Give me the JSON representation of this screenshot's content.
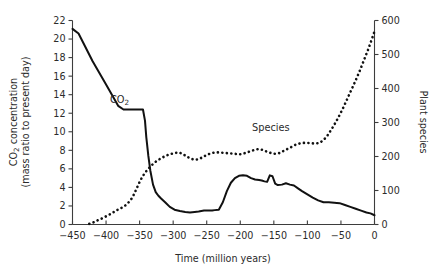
{
  "chart_data": {
    "type": "line",
    "title": "",
    "xlabel": "Time (million years)",
    "ylabel": "CO2 concentration (mass ratio to present day)",
    "y2label": "Plant species",
    "xlim": [
      -450,
      0
    ],
    "ylim": [
      0,
      22
    ],
    "y2lim": [
      0,
      600
    ],
    "grid": false,
    "legend_position": "inline-annotations",
    "xticks": [
      -450,
      -400,
      -350,
      -300,
      -250,
      -200,
      -150,
      -100,
      -50,
      0
    ],
    "xticklabels": [
      "−450",
      "−400",
      "−350",
      "−300",
      "−250",
      "−200",
      "−150",
      "−100",
      "−50",
      "0"
    ],
    "yticks": [
      0,
      2,
      4,
      6,
      8,
      10,
      12,
      14,
      16,
      18,
      20,
      22
    ],
    "yticklabels": [
      "0",
      "2",
      "4",
      "6",
      "8",
      "10",
      "12",
      "14",
      "16",
      "18",
      "20",
      "22"
    ],
    "y2ticks": [
      0,
      100,
      200,
      300,
      400,
      500,
      600
    ],
    "y2ticklabels": [
      "0",
      "100",
      "200",
      "300",
      "400",
      "500",
      "600"
    ],
    "annotations": [
      {
        "text": "CO2",
        "x": -388,
        "y": 13.8,
        "series": "co2"
      },
      {
        "text": "Species",
        "x": -180,
        "y": 9.9,
        "series": "species"
      }
    ],
    "series": [
      {
        "name": "CO2",
        "axis": "left",
        "style": "solid",
        "label_text": "CO₂",
        "x": [
          -450,
          -441,
          -420,
          -400,
          -382,
          -374,
          -368,
          -360,
          -356,
          -352,
          -348,
          -345,
          -342,
          -340,
          -337,
          -334,
          -330,
          -326,
          -322,
          -318,
          -312,
          -305,
          -298,
          -290,
          -282,
          -275,
          -268,
          -262,
          -258,
          -254,
          -250,
          -246,
          -242,
          -238,
          -232,
          -226,
          -220,
          -214,
          -208,
          -202,
          -196,
          -190,
          -184,
          -178,
          -172,
          -168,
          -164,
          -160,
          -156,
          -152,
          -148,
          -144,
          -138,
          -132,
          -126,
          -120,
          -114,
          -108,
          -100,
          -92,
          -84,
          -76,
          -68,
          -60,
          -52,
          -44,
          -36,
          -28,
          -20,
          -12,
          -6,
          0
        ],
        "y": [
          21.1,
          20.6,
          17.6,
          15.1,
          12.8,
          12.4,
          12.4,
          12.4,
          12.4,
          12.4,
          12.4,
          12.4,
          11.2,
          9.4,
          7.4,
          5.8,
          4.3,
          3.5,
          3.1,
          2.8,
          2.4,
          1.9,
          1.6,
          1.45,
          1.35,
          1.3,
          1.35,
          1.4,
          1.45,
          1.5,
          1.5,
          1.5,
          1.5,
          1.55,
          1.6,
          2.4,
          3.6,
          4.5,
          5.0,
          5.25,
          5.3,
          5.25,
          5.0,
          4.85,
          4.8,
          4.75,
          4.65,
          4.6,
          5.3,
          5.2,
          4.4,
          4.25,
          4.3,
          4.45,
          4.3,
          4.2,
          3.9,
          3.6,
          3.25,
          2.9,
          2.6,
          2.4,
          2.4,
          2.35,
          2.3,
          2.1,
          1.9,
          1.7,
          1.5,
          1.3,
          1.2,
          1.0
        ]
      },
      {
        "name": "Species",
        "axis": "right",
        "style": "dotted",
        "label_text": "Species",
        "x": [
          -425,
          -418,
          -412,
          -406,
          -400,
          -394,
          -389,
          -384,
          -379,
          -374,
          -370,
          -366,
          -362,
          -358,
          -354,
          -350,
          -346,
          -342,
          -338,
          -333,
          -328,
          -322,
          -316,
          -310,
          -304,
          -298,
          -292,
          -286,
          -280,
          -274,
          -268,
          -262,
          -256,
          -250,
          -244,
          -238,
          -232,
          -226,
          -220,
          -214,
          -208,
          -202,
          -196,
          -190,
          -184,
          -178,
          -172,
          -166,
          -160,
          -154,
          -148,
          -142,
          -136,
          -130,
          -124,
          -118,
          -112,
          -106,
          -100,
          -94,
          -88,
          -82,
          -76,
          -70,
          -64,
          -58,
          -52,
          -46,
          -40,
          -34,
          -28,
          -22,
          -16,
          -10,
          -4,
          0
        ],
        "y": [
          2,
          7,
          13,
          18,
          24,
          30,
          36,
          42,
          47,
          52,
          58,
          66,
          76,
          90,
          108,
          125,
          140,
          152,
          162,
          172,
          182,
          190,
          197,
          203,
          207,
          210,
          212,
          208,
          200,
          194,
          190,
          192,
          198,
          205,
          209,
          212,
          212,
          211,
          210,
          209,
          208,
          206,
          208,
          212,
          216,
          220,
          222,
          219,
          214,
          210,
          208,
          210,
          216,
          222,
          228,
          234,
          238,
          240,
          240,
          239,
          238,
          240,
          248,
          262,
          280,
          300,
          322,
          346,
          372,
          398,
          424,
          452,
          482,
          512,
          545,
          568
        ]
      }
    ]
  },
  "axes": {
    "left_title_line1": "CO₂ concentration",
    "left_title_line2": "(mass ratio to present day)",
    "right_title": "Plant species",
    "bottom_title": "Time (million years)"
  }
}
